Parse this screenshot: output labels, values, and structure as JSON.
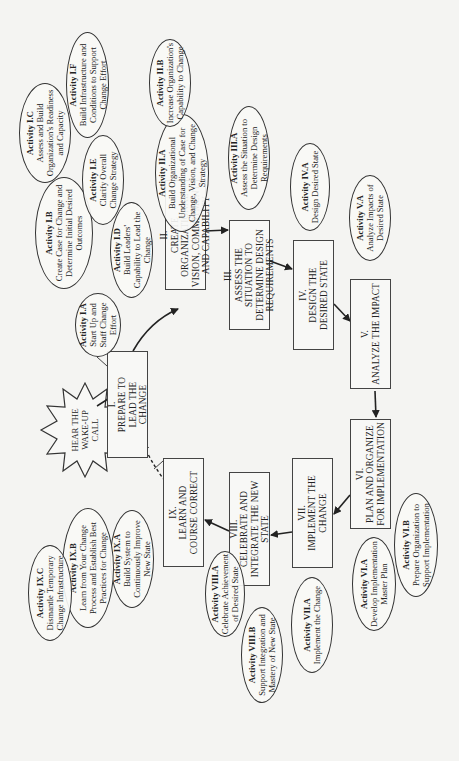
{
  "start": {
    "label": "HEAR THE WAKE-UP CALL"
  },
  "phases": [
    {
      "num": "I.",
      "title": "PREPARE TO LEAD THE CHANGE"
    },
    {
      "num": "II.",
      "title": "CREATE ORGANIZATIONAL VISION, COMMITMENT, AND CAPABILITY"
    },
    {
      "num": "III.",
      "title": "ASSESS THE SITUATION TO DETERMINE DESIGN REQUIREMENTS"
    },
    {
      "num": "IV.",
      "title": "DESIGN THE DESIRED STATE"
    },
    {
      "num": "V.",
      "title": "ANALYZE THE IMPACT"
    },
    {
      "num": "VI.",
      "title": "PLAN AND ORGANIZE FOR IMPLEMENTATION"
    },
    {
      "num": "VII.",
      "title": "IMPLEMENT THE CHANGE"
    },
    {
      "num": "VIII.",
      "title": "CELEBRATE AND INTEGRATE THE NEW STATE"
    },
    {
      "num": "IX.",
      "title": "LEARN AND COURSE CORRECT"
    }
  ],
  "activities": {
    "IA": {
      "title": "Activity I.A",
      "desc": "Start Up and Staff Change Effort"
    },
    "IB": {
      "title": "Activity I.B",
      "desc": "Create Case for Change and Determine Initial Desired Outcomes"
    },
    "IC": {
      "title": "Activity I.C",
      "desc": "Assess and Build Organization's Readiness and Capacity"
    },
    "ID": {
      "title": "Activity I.D",
      "desc": "Build Leaders' Capability to Lead the Change"
    },
    "IE": {
      "title": "Activity I.E",
      "desc": "Clarify Overall Change Strategy"
    },
    "IF": {
      "title": "Activity I.F",
      "desc": "Build Infrastructure and Conditions to Support Change Effort"
    },
    "IIA": {
      "title": "Activity II.A",
      "desc": "Build Organizational Understanding of Case for Change, Vision, and Change Strategy"
    },
    "IIB": {
      "title": "Activity II.B",
      "desc": "Increase Organization's Capability to Change"
    },
    "IIIA": {
      "title": "Activity III.A",
      "desc": "Assess the Situation to Determine Design Requirements"
    },
    "IVA": {
      "title": "Activity IV.A",
      "desc": "Design Desired State"
    },
    "VA": {
      "title": "Activity V.A",
      "desc": "Analyze Impacts of Desired State"
    },
    "VIA": {
      "title": "Activity VI.A",
      "desc": "Develop Implementation Master Plan"
    },
    "VIB": {
      "title": "Activity VI.B",
      "desc": "Prepare Organization to Support Implementation"
    },
    "VIIA": {
      "title": "Activity VII.A",
      "desc": "Implement the Change"
    },
    "VIIIA": {
      "title": "Activity VIII.A",
      "desc": "Celebrate Achievement of Desired State"
    },
    "VIIIB": {
      "title": "Activity VIII.B",
      "desc": "Support Integration and Mastery of New State"
    },
    "IXA": {
      "title": "Activity IX.A",
      "desc": "Build System to Continuously Improve New State"
    },
    "IXB": {
      "title": "Activity IX.B",
      "desc": "Learn from Your Change Process and Establish Best Practices for Change"
    },
    "IXC": {
      "title": "Activity IX.C",
      "desc": "Dismantle Temporary Change Infrastructure"
    }
  },
  "colors": {
    "line": "#333333",
    "background": "#f4f4f2"
  }
}
